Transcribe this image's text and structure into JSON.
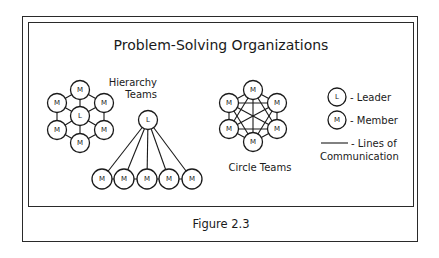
{
  "title": "Problem-Solving Organizations",
  "caption": "Figure 2.3",
  "hierarchy": {
    "label_line1": "Hierarchy",
    "label_line2": "Teams",
    "leader": "L",
    "members": [
      "M",
      "M",
      "M",
      "M",
      "M"
    ]
  },
  "hex_team": {
    "leader": "L",
    "members": [
      "M",
      "M",
      "M",
      "M",
      "M",
      "M"
    ]
  },
  "circle_team": {
    "label": "Circle Teams",
    "members": [
      "M",
      "M",
      "M",
      "M",
      "M",
      "M"
    ]
  },
  "legend": {
    "leader_symbol": "L",
    "leader_label": "- Leader",
    "member_symbol": "M",
    "member_label": "- Member",
    "line_label_line1": "- Lines of",
    "line_label_line2": "Communication"
  }
}
